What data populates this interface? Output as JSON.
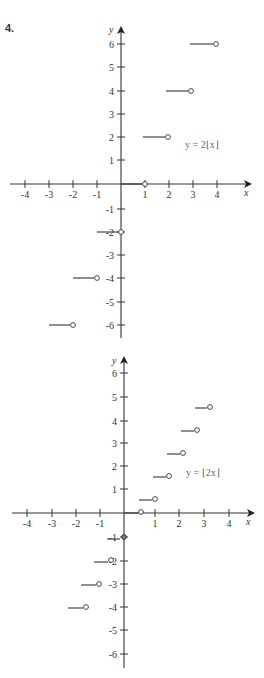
{
  "problem_number": "4.",
  "chart_data": [
    {
      "type": "line",
      "subtype": "step",
      "title": "",
      "equation_label": "y = 2⌊x⌋",
      "xlabel": "x",
      "ylabel": "y",
      "xlim": [
        -4,
        4
      ],
      "ylim": [
        -6,
        6
      ],
      "x_ticks": [
        "-4",
        "-3",
        "-2",
        "-1",
        "1",
        "2",
        "3",
        "4"
      ],
      "y_ticks": [
        "6",
        "5",
        "4",
        "3",
        "2",
        "1",
        "-1",
        "-2",
        "-3",
        "-4",
        "-5",
        "-6"
      ],
      "grid": false,
      "segments": [
        {
          "x_start": -3,
          "x_end": -2,
          "y": -6,
          "left": "closed",
          "right": "open"
        },
        {
          "x_start": -2,
          "x_end": -1,
          "y": -4,
          "left": "closed",
          "right": "open"
        },
        {
          "x_start": -1,
          "x_end": 0,
          "y": -2,
          "left": "closed",
          "right": "open"
        },
        {
          "x_start": 0,
          "x_end": 1,
          "y": 0,
          "left": "closed",
          "right": "open"
        },
        {
          "x_start": 1,
          "x_end": 2,
          "y": 2,
          "left": "closed",
          "right": "open"
        },
        {
          "x_start": 2,
          "x_end": 3,
          "y": 4,
          "left": "closed",
          "right": "open"
        },
        {
          "x_start": 3,
          "x_end": 4,
          "y": 6,
          "left": "closed",
          "right": "open"
        }
      ],
      "marked_points": [
        {
          "x": 1,
          "y": 0,
          "style": "open-with-tick"
        },
        {
          "x": 0,
          "y": -2,
          "style": "open-with-tick"
        }
      ]
    },
    {
      "type": "line",
      "subtype": "step",
      "title": "",
      "equation_label": "y = ⌊2x⌋",
      "xlabel": "x",
      "ylabel": "y",
      "xlim": [
        -4,
        4
      ],
      "ylim": [
        -6,
        6
      ],
      "x_ticks": [
        "-4",
        "-3",
        "-2",
        "-1",
        "1",
        "2",
        "3",
        "4"
      ],
      "y_ticks": [
        "6",
        "5",
        "4",
        "3",
        "2",
        "1",
        "-1",
        "-2",
        "-3",
        "-4",
        "-5",
        "-6"
      ],
      "grid": false,
      "segments": [
        {
          "x_start": -2,
          "x_end": -1.5,
          "y": -4,
          "left": "closed",
          "right": "open"
        },
        {
          "x_start": -1.5,
          "x_end": -1,
          "y": -3,
          "left": "closed",
          "right": "open"
        },
        {
          "x_start": -1,
          "x_end": -0.5,
          "y": -2,
          "left": "closed",
          "right": "open"
        },
        {
          "x_start": -0.5,
          "x_end": 0,
          "y": -1,
          "left": "closed",
          "right": "open"
        },
        {
          "x_start": 0,
          "x_end": 0.5,
          "y": 0,
          "left": "closed",
          "right": "open"
        },
        {
          "x_start": 0.5,
          "x_end": 1,
          "y": 1,
          "left": "closed",
          "right": "open"
        },
        {
          "x_start": 1,
          "x_end": 1.5,
          "y": 2,
          "left": "closed",
          "right": "open"
        },
        {
          "x_start": 1.5,
          "x_end": 2,
          "y": 3,
          "left": "closed",
          "right": "open"
        },
        {
          "x_start": 2,
          "x_end": 2.5,
          "y": 4,
          "left": "closed",
          "right": "open"
        },
        {
          "x_start": 2.5,
          "x_end": 3,
          "y": 5,
          "left": "closed",
          "right": "open"
        }
      ],
      "marked_points": [
        {
          "x": 0,
          "y": -1,
          "style": "closed-dot"
        }
      ]
    }
  ],
  "graphs": [
    {
      "equation_label": "y = 2⌊x⌋",
      "x_axis_label": "x",
      "y_axis_label": "y",
      "x_ticks": [
        {
          "label": "-4",
          "px": 25
        },
        {
          "label": "-3",
          "px": 49
        },
        {
          "label": "-2",
          "px": 73
        },
        {
          "label": "-1",
          "px": 97
        },
        {
          "label": "1",
          "px": 145
        },
        {
          "label": "2",
          "px": 169
        },
        {
          "label": "3",
          "px": 193
        },
        {
          "label": "4",
          "px": 217
        }
      ],
      "y_ticks": [
        {
          "label": "6",
          "py": 44
        },
        {
          "label": "5",
          "py": 67
        },
        {
          "label": "4",
          "py": 91
        },
        {
          "label": "3",
          "py": 114
        },
        {
          "label": "2",
          "py": 137
        },
        {
          "label": "1",
          "py": 160
        },
        {
          "label": "-1",
          "py": 209
        },
        {
          "label": "-2",
          "py": 232
        },
        {
          "label": "-3",
          "py": 255
        },
        {
          "label": "-4",
          "py": 278
        },
        {
          "label": "-5",
          "py": 302
        },
        {
          "label": "-6",
          "py": 325
        }
      ]
    },
    {
      "equation_label": "y = ⌊2x⌋",
      "x_axis_label": "x",
      "y_axis_label": "y",
      "x_ticks": [
        {
          "label": "-4",
          "px": 27
        },
        {
          "label": "-3",
          "px": 52
        },
        {
          "label": "-2",
          "px": 76
        },
        {
          "label": "-1",
          "px": 100
        },
        {
          "label": "1",
          "px": 155
        },
        {
          "label": "2",
          "px": 179
        },
        {
          "label": "3",
          "px": 204
        },
        {
          "label": "4",
          "px": 229
        }
      ],
      "y_ticks": [
        {
          "label": "6",
          "py": 373
        },
        {
          "label": "5",
          "py": 397
        },
        {
          "label": "4",
          "py": 421
        },
        {
          "label": "3",
          "py": 443
        },
        {
          "label": "2",
          "py": 466
        },
        {
          "label": "1",
          "py": 489
        },
        {
          "label": "-1",
          "py": 537
        },
        {
          "label": "-2",
          "py": 561
        },
        {
          "label": "-3",
          "py": 584
        },
        {
          "label": "-4",
          "py": 607
        },
        {
          "label": "-5",
          "py": 630
        },
        {
          "label": "-6",
          "py": 654
        }
      ]
    }
  ]
}
